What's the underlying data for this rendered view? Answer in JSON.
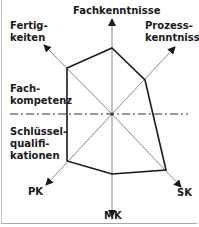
{
  "diagram": {
    "type": "radar/spider competence profile",
    "axes": [
      {
        "id": "fachkenntnisse",
        "label": "Fachkenntnisse"
      },
      {
        "id": "prozesskenntnisse",
        "label": "Prozess-\nkenntnisse"
      },
      {
        "id": "sk",
        "label": "SK"
      },
      {
        "id": "mk",
        "label": "MK"
      },
      {
        "id": "pk",
        "label": "PK"
      },
      {
        "id": "fertigkeiten",
        "label": "Fertig-\nkeiten"
      }
    ],
    "regions": {
      "upper": "Fach-\nkompetenz",
      "lower": "Schlüssel-\nqualifi-\nkationen"
    },
    "colors": {
      "axis": "#8a8a8a",
      "profile": "#1a1a1a",
      "divider": "#333333",
      "frame": "#b0b0b0"
    }
  }
}
